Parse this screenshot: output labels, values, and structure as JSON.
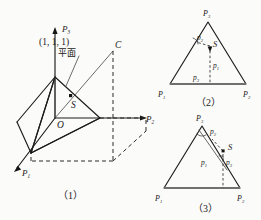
{
  "figure_set": {
    "title": "Simplex plane and barycentric coordinate diagrams",
    "background_color": "#fbfbf9",
    "ink_color": "#1c1c1c"
  },
  "figure1": {
    "caption": "（1）",
    "axes": [
      {
        "name": "P3",
        "base": "P",
        "sub": "3",
        "direction": "up"
      },
      {
        "name": "P2",
        "base": "P",
        "sub": "2",
        "direction": "right"
      },
      {
        "name": "P1",
        "base": "P",
        "sub": "1",
        "direction": "lower-left"
      }
    ],
    "annotations": {
      "coordinate_point": "(1, 1, 1)",
      "plane_label": "平面",
      "corner_label": "C",
      "origin_label": "O",
      "point_label": "S"
    }
  },
  "figure2": {
    "caption": "（2）",
    "vertices": [
      {
        "label_base": "P",
        "sub": "1",
        "position": "bottom-left"
      },
      {
        "label_base": "P",
        "sub": "2",
        "position": "bottom-right"
      },
      {
        "label_base": "P",
        "sub": "3",
        "position": "apex"
      }
    ],
    "interior_labels": [
      {
        "base": "p",
        "sub": "2"
      },
      {
        "base": "p",
        "sub": "1"
      },
      {
        "base": "p",
        "sub": "3"
      }
    ],
    "point_label": "S",
    "point_inside": "true"
  },
  "figure3": {
    "caption": "（3）",
    "vertices": [
      {
        "label_base": "P",
        "sub": "1",
        "position": "bottom-left"
      },
      {
        "label_base": "P",
        "sub": "2",
        "position": "bottom-right"
      },
      {
        "label_base": "P",
        "sub": "3",
        "position": "apex"
      }
    ],
    "interior_labels": [
      {
        "base": "p",
        "sub": "2"
      },
      {
        "base": "p",
        "sub": "1"
      },
      {
        "base": "p",
        "sub": "3"
      }
    ],
    "point_label": "S",
    "point_inside": "false"
  }
}
